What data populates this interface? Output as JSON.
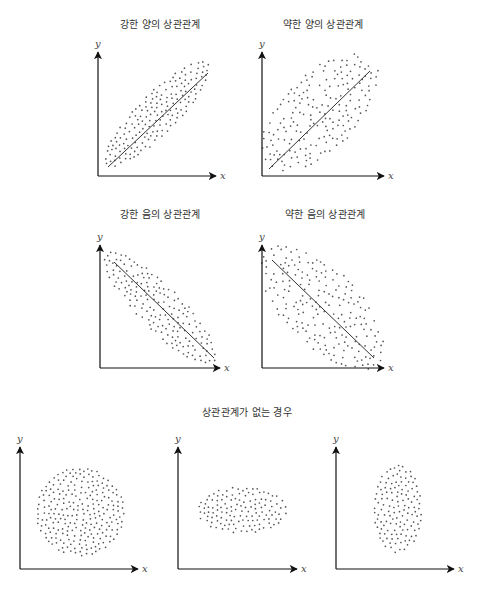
{
  "figure": {
    "width": 494,
    "height": 609,
    "colors": {
      "axis": "#111111",
      "dot": "#555555",
      "line": "#333333",
      "text": "#333333"
    },
    "axis_labels": {
      "x": "x",
      "y": "y"
    }
  },
  "titles": {
    "strong_positive": "강한 양의 상관관계",
    "weak_positive": "약한 양의 상관관계",
    "strong_negative": "강한 음의 상관관계",
    "weak_negative": "약한 음의 상관관계",
    "no_correlation": "상관관계가 없는 경우"
  },
  "title_positions": {
    "strong_positive": {
      "x": 160,
      "y": 24
    },
    "weak_positive": {
      "x": 323,
      "y": 24
    },
    "strong_negative": {
      "x": 160,
      "y": 214
    },
    "weak_negative": {
      "x": 325,
      "y": 214
    },
    "no_correlation": {
      "x": 247,
      "y": 412
    }
  },
  "chart_data": [
    {
      "type": "scatter",
      "title": "강한 양의 상관관계",
      "xlabel": "x",
      "ylabel": "y",
      "correlation": "strong positive",
      "axes": {
        "ox": 98,
        "oy": 176,
        "xend": 216,
        "ytop": 52
      },
      "cloud": {
        "cx": 157,
        "cy": 114,
        "rx": 72,
        "ry": 20,
        "angle": -45,
        "n": 170,
        "seed": 11
      },
      "trend_line": {
        "x1": 108,
        "y1": 167,
        "x2": 208,
        "y2": 73
      }
    },
    {
      "type": "scatter",
      "title": "약한 양의 상관관계",
      "xlabel": "x",
      "ylabel": "y",
      "correlation": "weak positive",
      "axes": {
        "ox": 262,
        "oy": 176,
        "xend": 384,
        "ytop": 52
      },
      "cloud": {
        "cx": 320,
        "cy": 112,
        "rx": 74,
        "ry": 38,
        "angle": -45,
        "n": 190,
        "seed": 23
      },
      "trend_line": {
        "x1": 269,
        "y1": 169,
        "x2": 370,
        "y2": 71
      }
    },
    {
      "type": "scatter",
      "title": "강한 음의 상관관계",
      "xlabel": "x",
      "ylabel": "y",
      "correlation": "strong negative",
      "axes": {
        "ox": 100,
        "oy": 368,
        "xend": 220,
        "ytop": 245
      },
      "cloud": {
        "cx": 160,
        "cy": 308,
        "rx": 76,
        "ry": 22,
        "angle": 45,
        "n": 170,
        "seed": 37
      },
      "trend_line": {
        "x1": 114,
        "y1": 262,
        "x2": 214,
        "y2": 358
      }
    },
    {
      "type": "scatter",
      "title": "약한 음의 상관관계",
      "xlabel": "x",
      "ylabel": "y",
      "correlation": "weak negative",
      "axes": {
        "ox": 262,
        "oy": 368,
        "xend": 384,
        "ytop": 245
      },
      "cloud": {
        "cx": 322,
        "cy": 307,
        "rx": 80,
        "ry": 38,
        "angle": 45,
        "n": 200,
        "seed": 51
      },
      "trend_line": {
        "x1": 272,
        "y1": 260,
        "x2": 374,
        "y2": 358
      }
    },
    {
      "type": "scatter",
      "title": "상관관계가 없는 경우",
      "xlabel": "x",
      "ylabel": "y",
      "correlation": "none (circular)",
      "axes": {
        "ox": 20,
        "oy": 569,
        "xend": 138,
        "ytop": 447
      },
      "cloud": {
        "cx": 80,
        "cy": 512,
        "rx": 44,
        "ry": 44,
        "angle": 0,
        "n": 260,
        "seed": 67
      },
      "trend_line": null
    },
    {
      "type": "scatter",
      "title": "상관관계가 없는 경우",
      "xlabel": "x",
      "ylabel": "y",
      "correlation": "none (horizontal ellipse)",
      "axes": {
        "ox": 178,
        "oy": 569,
        "xend": 297,
        "ytop": 447
      },
      "cloud": {
        "cx": 242,
        "cy": 510,
        "rx": 45,
        "ry": 23,
        "angle": 0,
        "n": 170,
        "seed": 79
      },
      "trend_line": null
    },
    {
      "type": "scatter",
      "title": "상관관계가 없는 경우",
      "xlabel": "x",
      "ylabel": "y",
      "correlation": "none (vertical ellipse)",
      "axes": {
        "ox": 336,
        "oy": 569,
        "xend": 454,
        "ytop": 447
      },
      "cloud": {
        "cx": 398,
        "cy": 509,
        "rx": 24,
        "ry": 44,
        "angle": 0,
        "n": 170,
        "seed": 97
      },
      "trend_line": null
    }
  ]
}
